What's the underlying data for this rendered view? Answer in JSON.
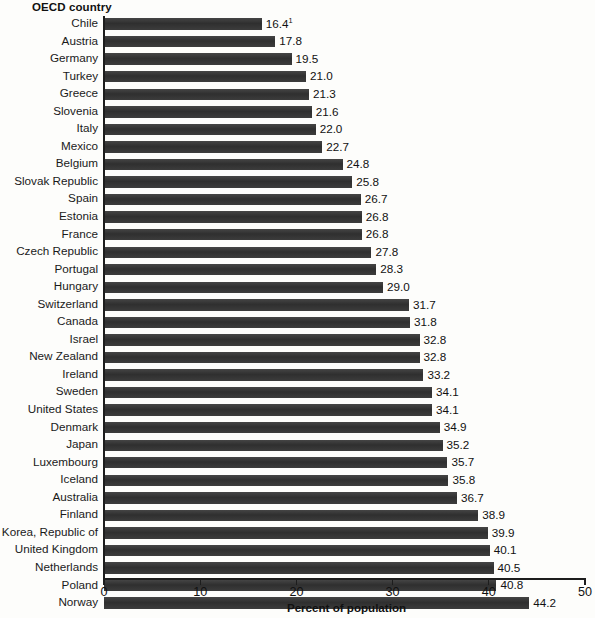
{
  "header": {
    "category_axis_label": "OECD country"
  },
  "chart_data": {
    "type": "bar",
    "orientation": "horizontal",
    "title": "",
    "xlabel": "Percent of population",
    "ylabel": "OECD country",
    "xlim": [
      0,
      50
    ],
    "xticks": [
      "0",
      "10",
      "20",
      "30",
      "40",
      "50"
    ],
    "xtick_values": [
      0,
      10,
      20,
      30,
      40,
      50
    ],
    "grid": false,
    "legend": "none",
    "bar_color": "#3a3a3a",
    "categories": [
      "Chile",
      "Austria",
      "Germany",
      "Turkey",
      "Greece",
      "Slovenia",
      "Italy",
      "Mexico",
      "Belgium",
      "Slovak Republic",
      "Spain",
      "Estonia",
      "France",
      "Czech Republic",
      "Portugal",
      "Hungary",
      "Switzerland",
      "Canada",
      "Israel",
      "New Zealand",
      "Ireland",
      "Sweden",
      "United States",
      "Denmark",
      "Japan",
      "Luxembourg",
      "Iceland",
      "Australia",
      "Finland",
      "Korea, Republic of",
      "United Kingdom",
      "Netherlands",
      "Poland",
      "Norway"
    ],
    "values": [
      16.4,
      17.8,
      19.5,
      21.0,
      21.3,
      21.6,
      22.0,
      22.7,
      24.8,
      25.8,
      26.7,
      26.8,
      26.8,
      27.8,
      28.3,
      29.0,
      31.7,
      31.8,
      32.8,
      32.8,
      33.2,
      34.1,
      34.1,
      34.9,
      35.2,
      35.7,
      35.8,
      36.7,
      38.9,
      39.9,
      40.1,
      40.5,
      40.8,
      44.2
    ],
    "value_labels": [
      "16.4",
      "17.8",
      "19.5",
      "21.0",
      "21.3",
      "21.6",
      "22.0",
      "22.7",
      "24.8",
      "25.8",
      "26.7",
      "26.8",
      "26.8",
      "27.8",
      "28.3",
      "29.0",
      "31.7",
      "31.8",
      "32.8",
      "32.8",
      "33.2",
      "34.1",
      "34.1",
      "34.9",
      "35.2",
      "35.7",
      "35.8",
      "36.7",
      "38.9",
      "39.9",
      "40.1",
      "40.5",
      "40.8",
      "44.2"
    ],
    "footnote_markers": {
      "0": "1"
    }
  }
}
